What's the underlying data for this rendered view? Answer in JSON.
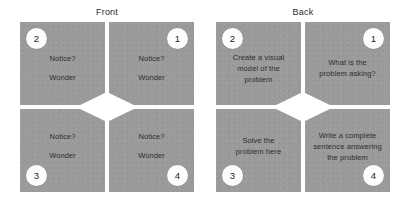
{
  "canvas": {
    "width": 410,
    "height": 206,
    "background": "#ffffff"
  },
  "theme": {
    "panel_gray": "#9b9b9b",
    "badge_fill": "#ffffff",
    "text_color": "#2e2e2e",
    "gap_color": "#ffffff"
  },
  "groups": [
    {
      "id": "front",
      "label": "Front",
      "quadrants": [
        {
          "badge": "2",
          "position": "top-left",
          "lines": [
            "Notice?",
            "Wonder"
          ]
        },
        {
          "badge": "1",
          "position": "top-right",
          "lines": [
            "Notice?",
            "Wonder"
          ]
        },
        {
          "badge": "3",
          "position": "bottom-left",
          "lines": [
            "Notice?",
            "Wonder"
          ]
        },
        {
          "badge": "4",
          "position": "bottom-right",
          "lines": [
            "Notice?",
            "Wonder"
          ]
        }
      ]
    },
    {
      "id": "back",
      "label": "Back",
      "quadrants": [
        {
          "badge": "2",
          "position": "top-left",
          "lines": [
            "Create a visual",
            "model of the",
            "problem"
          ]
        },
        {
          "badge": "1",
          "position": "top-right",
          "lines": [
            "What is the",
            "problem asking?"
          ]
        },
        {
          "badge": "3",
          "position": "bottom-left",
          "lines": [
            "Solve the",
            "problem here"
          ]
        },
        {
          "badge": "4",
          "position": "bottom-right",
          "lines": [
            "Write a complete",
            "sentence answering",
            "the problem"
          ]
        }
      ]
    }
  ]
}
